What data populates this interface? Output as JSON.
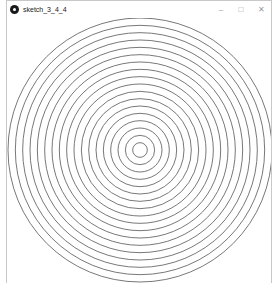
{
  "window": {
    "title": "sketch_3_4_4",
    "controls": {
      "minimize": "–",
      "maximize": "□",
      "close": "✕"
    }
  },
  "canvas": {
    "background": "#ffffff",
    "stroke": "#555555",
    "center": [
      133,
      132
    ],
    "ring_count": 18,
    "outer_radius": 132
  }
}
